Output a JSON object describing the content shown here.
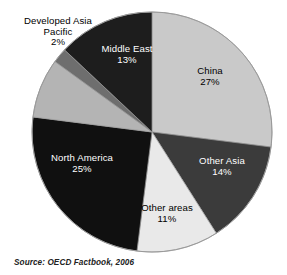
{
  "chart_data": {
    "type": "pie",
    "title": "",
    "subtitle": "",
    "xlabel": "",
    "ylabel": "",
    "legend_position": "none",
    "labels_inside": true,
    "source_note": "Source:  OECD Factbook, 2006",
    "categories": [
      "China",
      "Other Asia",
      "Other areas",
      "North America",
      "Developed Asia Pacific",
      "Middle East"
    ],
    "values": [
      27,
      14,
      11,
      25,
      2,
      13
    ],
    "unit": "%",
    "slices": [
      {
        "name": "China",
        "value": 27,
        "value_label": "27%",
        "color": "#c9c9c9",
        "text_color": "#000000",
        "start_angle": 0.0,
        "end_angle": 97.2
      },
      {
        "name": "Other Asia",
        "value": 14,
        "value_label": "14%",
        "color": "#3b3b3b",
        "text_color": "#ffffff",
        "start_angle": 97.2,
        "end_angle": 147.6
      },
      {
        "name": "Other areas",
        "value": 11,
        "value_label": "11%",
        "color": "#e9e9e9",
        "text_color": "#000000",
        "start_angle": 147.6,
        "end_angle": 187.2
      },
      {
        "name": "North America",
        "value": 25,
        "value_label": "25%",
        "color": "#101010",
        "text_color": "#ffffff",
        "start_angle": 187.2,
        "end_angle": 277.2
      },
      {
        "name": "Developed Asia Pacific",
        "value": 2,
        "value_label": "2%",
        "color": "#b4b4b4",
        "text_color": "#000000",
        "start_angle": 277.2,
        "end_angle": 306.0
      },
      {
        "name": "Developed Asia Pacific sliver",
        "value": 2,
        "value_label": "2%",
        "color": "#6e6e6e",
        "text_color": "#000000",
        "start_angle": 306.0,
        "end_angle": 313.2
      },
      {
        "name": "Middle East",
        "value": 13,
        "value_label": "13%",
        "color": "#1d1d1d",
        "text_color": "#ffffff",
        "start_angle": 313.2,
        "end_angle": 360.0
      }
    ],
    "geometry": {
      "center_x": 152,
      "center_y": 132,
      "radius": 120
    },
    "colors": {
      "china": "#c9c9c9",
      "other_asia": "#3b3b3b",
      "other_areas": "#e9e9e9",
      "north_america": "#101010",
      "developed_asia_pacific": "#b4b4b4",
      "middle_east": "#1d1d1d",
      "background": "#ffffff",
      "outline": "#9a9a9a"
    }
  },
  "labels": {
    "developed": {
      "line1": "Developed Asia",
      "line2": "Pacific",
      "pct": "2%"
    },
    "middle_east": {
      "name": "Middle East",
      "pct": "13%"
    },
    "china": {
      "name": "China",
      "pct": "27%"
    },
    "other_asia": {
      "name": "Other Asia",
      "pct": "14%"
    },
    "other_areas": {
      "name": "Other areas",
      "pct": "11%"
    },
    "north_america": {
      "name": "North America",
      "pct": "25%"
    }
  },
  "source": {
    "text": "Source:  OECD Factbook, 2006"
  }
}
